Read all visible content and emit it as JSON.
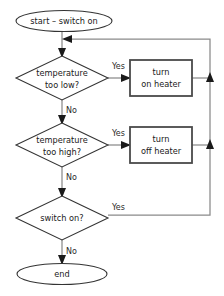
{
  "diagram": {
    "type": "flowchart",
    "colors": {
      "background": "#ffffff",
      "shape_stroke": "#333333",
      "process_stroke": "#4a4a4a",
      "connector": "#8a8a8a",
      "arrowhead": "#1a1a1a",
      "text": "#1a1a1a"
    },
    "nodes": {
      "start": {
        "shape": "terminator",
        "label": "start – switch on"
      },
      "decision_low": {
        "shape": "decision",
        "line1": "temperature",
        "line2": "too low?"
      },
      "process_on": {
        "shape": "process",
        "line1": "turn",
        "line2": "on heater"
      },
      "decision_high": {
        "shape": "decision",
        "line1": "temperature",
        "line2": "too high?"
      },
      "process_off": {
        "shape": "process",
        "line1": "turn",
        "line2": "off heater"
      },
      "decision_switch": {
        "shape": "decision",
        "line1": "switch on?"
      },
      "end": {
        "shape": "terminator",
        "label": "end"
      }
    },
    "branch_labels": {
      "low_yes": "Yes",
      "low_no": "No",
      "high_yes": "Yes",
      "high_no": "No",
      "switch_yes": "Yes",
      "switch_no": "No"
    }
  }
}
